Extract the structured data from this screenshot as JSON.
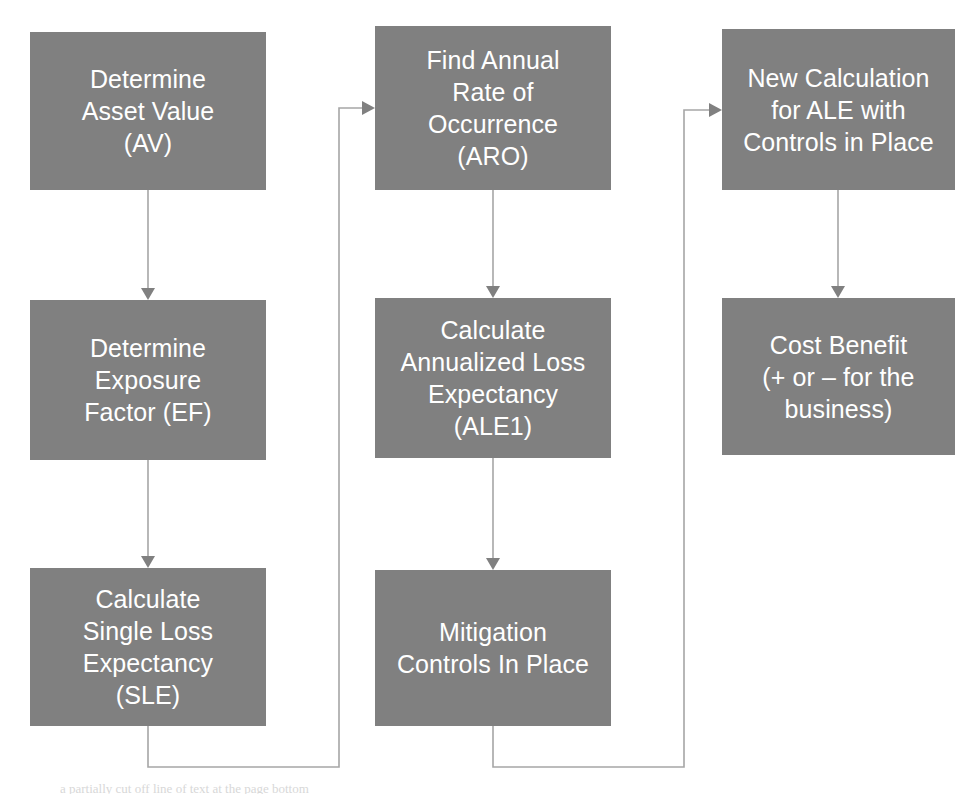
{
  "diagram": {
    "background_color": "#ffffff",
    "node_fill_color": "#808080",
    "node_text_color": "#ffffff",
    "connector_color": "#a6a6a6",
    "arrowhead_color": "#808080",
    "nodes": [
      {
        "id": "av",
        "label": "Determine\nAsset Value\n(AV)"
      },
      {
        "id": "ef",
        "label": "Determine\nExposure\nFactor (EF)"
      },
      {
        "id": "sle",
        "label": "Calculate\nSingle Loss\nExpectancy\n(SLE)"
      },
      {
        "id": "aro",
        "label": "Find Annual\nRate of\nOccurrence\n(ARO)"
      },
      {
        "id": "ale1",
        "label": "Calculate\nAnnualized Loss\nExpectancy\n(ALE1)"
      },
      {
        "id": "mcp",
        "label": "Mitigation\nControls In Place"
      },
      {
        "id": "newale",
        "label": "New Calculation\nfor ALE with\nControls in Place"
      },
      {
        "id": "cb",
        "label": "Cost Benefit\n(+ or – for the\nbusiness)"
      }
    ],
    "edges": [
      {
        "from": "av",
        "to": "ef",
        "style": "straight-down"
      },
      {
        "from": "ef",
        "to": "sle",
        "style": "straight-down"
      },
      {
        "from": "sle",
        "to": "aro",
        "style": "down-left-up-right"
      },
      {
        "from": "aro",
        "to": "ale1",
        "style": "straight-down"
      },
      {
        "from": "ale1",
        "to": "mcp",
        "style": "straight-down"
      },
      {
        "from": "mcp",
        "to": "newale",
        "style": "down-left-up-right"
      },
      {
        "from": "newale",
        "to": "cb",
        "style": "straight-down"
      }
    ],
    "footer_smudge": "a partially cut off line of text at the page bottom"
  }
}
